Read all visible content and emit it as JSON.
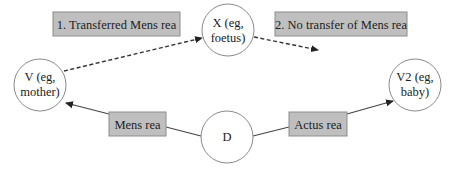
{
  "colors": {
    "background": "#ffffff",
    "box_fill": "#bfbfbf",
    "box_stroke": "#8c8c8c",
    "circle_stroke": "#8a8a8a",
    "line": "#444444",
    "text": "#222222"
  },
  "boxes": {
    "transferred": {
      "label": "1. Transferred Mens rea"
    },
    "no_transfer": {
      "label": "2. No transfer of Mens rea"
    },
    "mens_rea": {
      "label": "Mens rea"
    },
    "actus_rea": {
      "label": "Actus rea"
    }
  },
  "nodes": {
    "v": {
      "line1": "V (eg,",
      "line2": "mother)"
    },
    "x": {
      "line1": "X (eg,",
      "line2": "foetus)"
    },
    "d": {
      "line1": "D"
    },
    "v2": {
      "line1": "V2 (eg,",
      "line2": "baby)"
    }
  },
  "edges": [
    {
      "from": "v",
      "to": "x",
      "style": "dashed",
      "arrow": "end"
    },
    {
      "from": "x",
      "to": "open-end",
      "style": "dashed",
      "arrow": "end"
    },
    {
      "from": "d",
      "to": "v",
      "style": "solid",
      "arrow": "end",
      "via": "mens_rea"
    },
    {
      "from": "d",
      "to": "v2",
      "style": "solid",
      "arrow": "end",
      "via": "actus_rea"
    }
  ]
}
